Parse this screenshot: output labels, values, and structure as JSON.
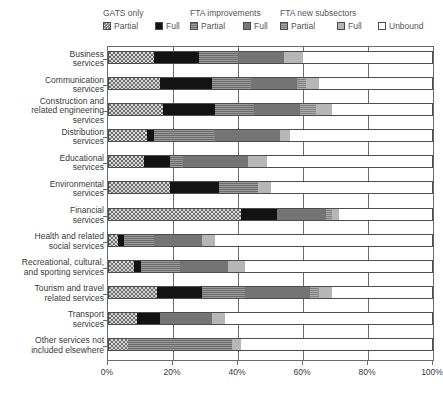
{
  "legend": {
    "groups": [
      {
        "title": "GATS only",
        "x": 103
      },
      {
        "title": "FTA improvements",
        "x": 190
      },
      {
        "title": "FTA new subsectors",
        "x": 280
      }
    ],
    "items": [
      {
        "label": "Partial",
        "key": "gats_partial",
        "x": 103
      },
      {
        "label": "Full",
        "key": "gats_full",
        "x": 155
      },
      {
        "label": "Partial",
        "key": "fta_imp_partial",
        "x": 190
      },
      {
        "label": "Full",
        "key": "fta_imp_full",
        "x": 243
      },
      {
        "label": "Partial",
        "key": "fta_new_partial",
        "x": 280
      },
      {
        "label": "Full",
        "key": "fta_new_full",
        "x": 337
      },
      {
        "label": "Unbound",
        "key": "unbound",
        "x": 378
      }
    ]
  },
  "chart_data": {
    "type": "bar",
    "orientation": "horizontal",
    "stacked": true,
    "title": "",
    "xlabel": "",
    "ylabel": "",
    "xlim": [
      0,
      100
    ],
    "xticks": [
      0,
      20,
      40,
      60,
      80,
      100
    ],
    "xticklabels": [
      "0%",
      "20%",
      "40%",
      "60%",
      "80%",
      "100%"
    ],
    "grid": true,
    "legend_position": "top",
    "series": [
      {
        "name": "GATS only - Partial",
        "key": "gats_partial"
      },
      {
        "name": "GATS only - Full",
        "key": "gats_full"
      },
      {
        "name": "FTA improvements - Partial",
        "key": "fta_imp_partial"
      },
      {
        "name": "FTA improvements - Full",
        "key": "fta_imp_full"
      },
      {
        "name": "FTA new subsectors - Partial",
        "key": "fta_new_partial"
      },
      {
        "name": "FTA new subsectors - Full",
        "key": "fta_new_full"
      },
      {
        "name": "Unbound",
        "key": "unbound"
      }
    ],
    "categories": [
      "Business services",
      "Communication services",
      "Construction and related engineering services",
      "Distribution services",
      "Educational services",
      "Environmental services",
      "Financial services",
      "Health and related social services",
      "Recreational, cultural, and sporting services",
      "Tourism and travel related services",
      "Transport services",
      "Other services not included elsewhere"
    ],
    "category_label_lines": [
      [
        "Business",
        "services"
      ],
      [
        "Communication",
        "services"
      ],
      [
        "Construction and",
        "related engineering",
        "services"
      ],
      [
        "Distribution",
        "services"
      ],
      [
        "Educational",
        "services"
      ],
      [
        "Environmental",
        "services"
      ],
      [
        "Financial",
        "services"
      ],
      [
        "Health and related",
        "social services"
      ],
      [
        "Recreational, cultural,",
        "and sporting services"
      ],
      [
        "Tourism and travel",
        "related services"
      ],
      [
        "Transport",
        "services"
      ],
      [
        "Other services not",
        "included elsewhere"
      ]
    ],
    "values": {
      "gats_partial": [
        14,
        16,
        17,
        12,
        11,
        19,
        41,
        3,
        8,
        15,
        9,
        6
      ],
      "gats_full": [
        14,
        16,
        16,
        2,
        8,
        15,
        11,
        2,
        2,
        14,
        7,
        0
      ],
      "fta_imp_partial": [
        12,
        12,
        12,
        19,
        4,
        12,
        0,
        9,
        12,
        13,
        0,
        32
      ],
      "fta_imp_full": [
        14,
        14,
        14,
        20,
        20,
        0,
        15,
        15,
        15,
        20,
        16,
        0
      ],
      "fta_new_partial": [
        0,
        3,
        5,
        0,
        0,
        0,
        2,
        0,
        0,
        3,
        0,
        0
      ],
      "fta_new_full": [
        6,
        4,
        5,
        3,
        6,
        4,
        2,
        4,
        5,
        4,
        4,
        3
      ],
      "unbound": [
        40,
        35,
        31,
        44,
        51,
        50,
        29,
        67,
        58,
        31,
        64,
        59
      ]
    },
    "row_totals_visible": [
      60,
      65,
      69,
      56,
      49,
      50,
      71,
      33,
      42,
      69,
      36,
      41
    ]
  }
}
